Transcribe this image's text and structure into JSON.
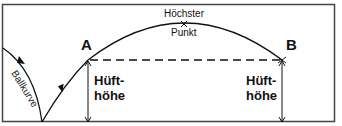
{
  "diagram": {
    "type": "trajectory",
    "labels": {
      "point_a": "A",
      "point_b": "B",
      "peak_line1": "Höchster",
      "peak_line2": "Punkt",
      "hip_height_left_1": "Hüft-",
      "hip_height_left_2": "höhe",
      "hip_height_right_1": "Hüft-",
      "hip_height_right_2": "höhe",
      "ball_curve": "Ballkurve"
    },
    "colors": {
      "line": "#111111",
      "border": "#444444",
      "background": "#ffffff"
    }
  }
}
